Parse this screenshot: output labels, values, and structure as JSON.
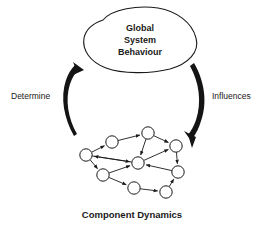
{
  "figure": {
    "title_blob": {
      "lines": [
        "Global",
        "System",
        "Behaviour"
      ],
      "line1": "Global",
      "line2": "System",
      "line3": "Behaviour"
    },
    "caption": "Component Dynamics",
    "arrows": {
      "left_label": "Determine",
      "right_label": "Influences"
    },
    "colors": {
      "background": "#ffffff",
      "ink": "#1a1a1a",
      "arrow_fill": "#141414",
      "node_fill": "#ffffff"
    },
    "graph": {
      "node_count": 9,
      "node_radius": 6.2,
      "nodes": [
        {
          "id": "n1",
          "x": 86,
          "y": 155
        },
        {
          "id": "n2",
          "x": 112,
          "y": 142
        },
        {
          "id": "n3",
          "x": 148,
          "y": 133
        },
        {
          "id": "n4",
          "x": 176,
          "y": 146
        },
        {
          "id": "n5",
          "x": 138,
          "y": 163
        },
        {
          "id": "n6",
          "x": 178,
          "y": 172
        },
        {
          "id": "n7",
          "x": 103,
          "y": 175
        },
        {
          "id": "n8",
          "x": 134,
          "y": 188
        },
        {
          "id": "n9",
          "x": 166,
          "y": 192
        }
      ],
      "edges": [
        {
          "from": "n2",
          "to": "n3"
        },
        {
          "from": "n3",
          "to": "n4"
        },
        {
          "from": "n1",
          "to": "n2"
        },
        {
          "from": "n3",
          "to": "n5"
        },
        {
          "from": "n5",
          "to": "n1"
        },
        {
          "from": "n1",
          "to": "n5"
        },
        {
          "from": "n4",
          "to": "n6"
        },
        {
          "from": "n6",
          "to": "n5"
        },
        {
          "from": "n1",
          "to": "n7"
        },
        {
          "from": "n7",
          "to": "n5"
        },
        {
          "from": "n7",
          "to": "n8"
        },
        {
          "from": "n8",
          "to": "n9"
        },
        {
          "from": "n9",
          "to": "n6"
        },
        {
          "from": "n5",
          "to": "n4"
        }
      ]
    }
  }
}
